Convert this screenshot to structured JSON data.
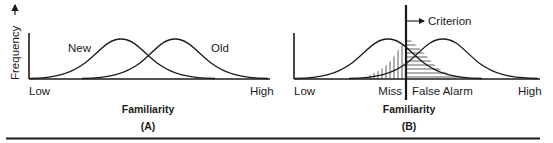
{
  "figure": {
    "panels": [
      {
        "id": "A",
        "caption": "(A)",
        "y_axis_label": "Frequency",
        "x_axis_label": "Familiarity",
        "x_low_label": "Low",
        "x_high_label": "High",
        "curve_labels": {
          "new": "New",
          "old": "Old"
        }
      },
      {
        "id": "B",
        "caption": "(B)",
        "x_axis_label": "Familiarity",
        "x_low_label": "Low",
        "x_high_label": "High",
        "criterion_label": "Criterion",
        "miss_label": "Miss",
        "false_alarm_label": "False Alarm"
      }
    ]
  },
  "colors": {
    "ink": "#1a1a1a",
    "background": "#ffffff"
  }
}
